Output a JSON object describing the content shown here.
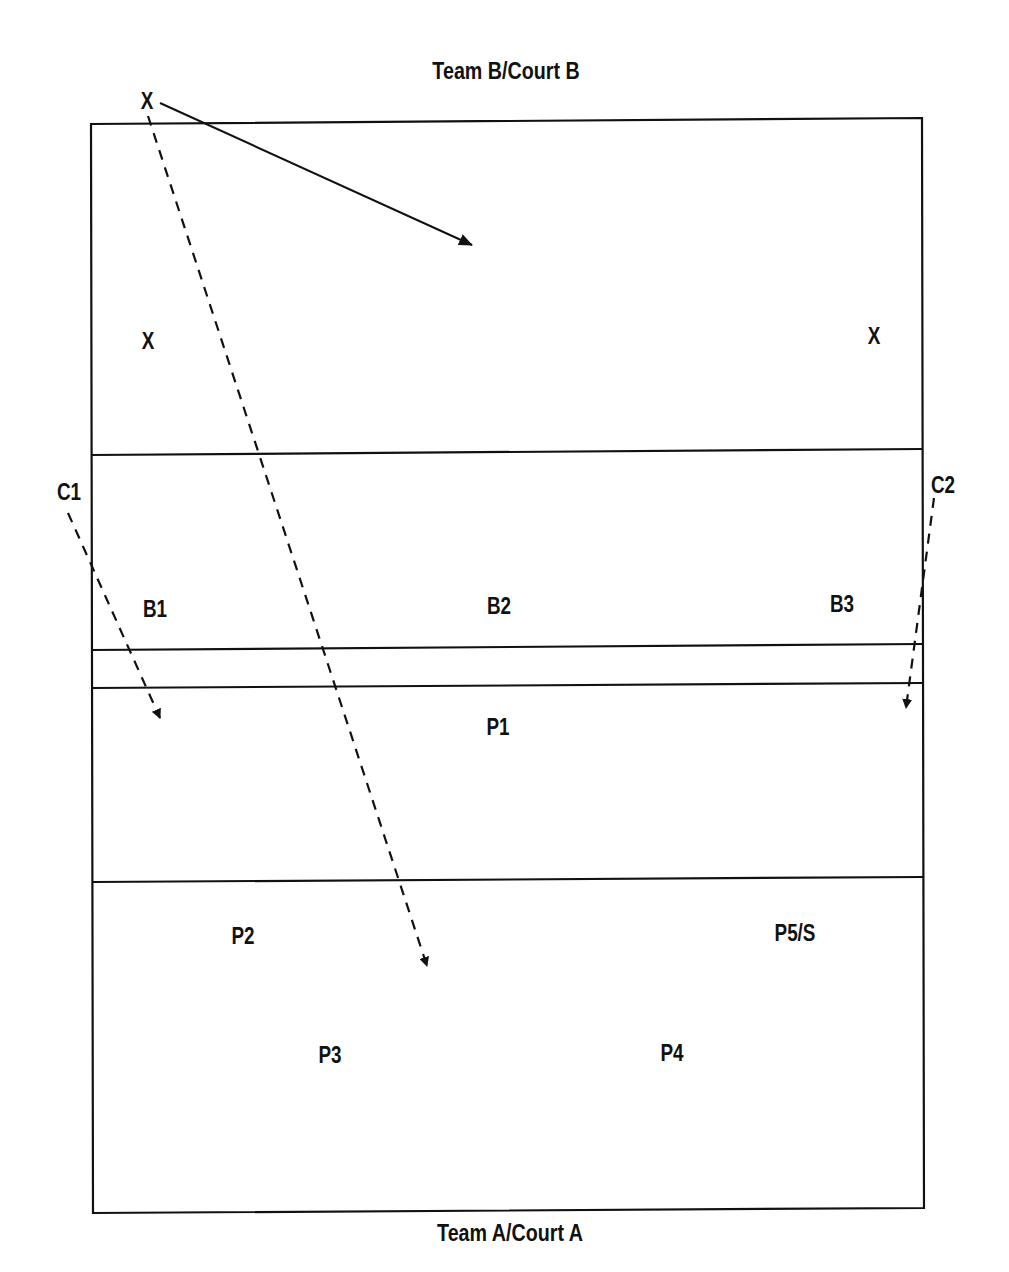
{
  "titles": {
    "top": "Team B/Court B",
    "bottom": "Team A/Court A"
  },
  "markers": {
    "server": "X",
    "x_left": "X",
    "x_right": "X",
    "c1": "C1",
    "c2": "C2",
    "b1": "B1",
    "b2": "B2",
    "b3": "B3",
    "p1": "P1",
    "p2": "P2",
    "p3": "P3",
    "p4": "P4",
    "p5": "P5/S"
  },
  "colors": {
    "line": "#111111",
    "background": "#ffffff"
  }
}
